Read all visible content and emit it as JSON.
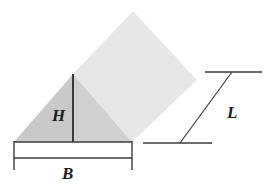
{
  "figure": {
    "background_color": "#ffffff",
    "width": 273,
    "height": 192,
    "labels": {
      "height": "H",
      "base": "B",
      "length": "L"
    },
    "colors": {
      "prism_top_face": "#e7e7e7",
      "prism_side_face": "#d9d9d9",
      "triangle_face": "#c9c9c9",
      "line": "#3a3a3a",
      "text": "#1c1c1c"
    },
    "geometry": {
      "triangle": {
        "left_vertex": [
          14,
          142
        ],
        "apex": [
          73,
          74
        ],
        "right_vertex": [
          132,
          142
        ]
      },
      "height_line": {
        "from": [
          73,
          74
        ],
        "to": [
          73,
          142
        ]
      },
      "top_face": {
        "points": [
          [
            73,
            74
          ],
          [
            133,
            11
          ],
          [
            197,
            80
          ],
          [
            132,
            142
          ]
        ]
      },
      "base_dimension": {
        "extension_left": [
          14,
          140,
          14,
          170
        ],
        "extension_right": [
          132,
          140,
          132,
          170
        ],
        "dimension_line": [
          14,
          158,
          132,
          158
        ]
      },
      "length_dimension": {
        "top_extension": [
          205,
          72,
          262,
          72
        ],
        "bottom_extension": [
          143,
          143,
          212,
          143
        ],
        "slant_line": [
          180,
          143,
          232,
          72
        ]
      }
    }
  }
}
